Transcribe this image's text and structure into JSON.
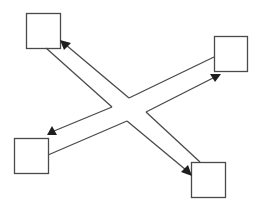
{
  "diagram": {
    "background": "#ffffff",
    "stroke_color": "#4a4a4a",
    "arrowhead_color": "#1e1e1e",
    "nodes": [
      {
        "id": "top-left",
        "x": 26,
        "y": 13,
        "w": 34,
        "h": 35
      },
      {
        "id": "top-right",
        "x": 214,
        "y": 36,
        "w": 33,
        "h": 35
      },
      {
        "id": "bottom-left",
        "x": 14,
        "y": 138,
        "w": 34,
        "h": 35
      },
      {
        "id": "bottom-right",
        "x": 191,
        "y": 162,
        "w": 34,
        "h": 35
      }
    ],
    "center": {
      "top": [
        129,
        98
      ],
      "left": [
        112,
        107
      ],
      "right": [
        146,
        112
      ],
      "bottom": [
        127,
        121
      ]
    },
    "arms": [
      {
        "to": "top-left",
        "arrow_tip": [
          60,
          40
        ],
        "plain_end": [
          46,
          48
        ]
      },
      {
        "to": "top-right",
        "arrow_tip": [
          221,
          74
        ],
        "plain_end": [
          214,
          57
        ]
      },
      {
        "to": "bottom-left",
        "arrow_tip": [
          48,
          134
        ],
        "plain_end": [
          48,
          155
        ]
      },
      {
        "to": "bottom-right",
        "arrow_tip": [
          191,
          175
        ],
        "plain_end": [
          200,
          162
        ]
      }
    ]
  }
}
